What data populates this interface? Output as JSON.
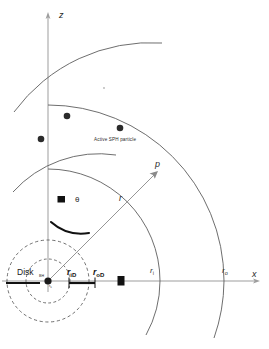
{
  "figure": {
    "background_color": "#ffffff",
    "line_color": "#555555",
    "axis_color": "#9a9a9a",
    "accent_color": "#111111",
    "dash_color": "#4a4a4a"
  },
  "axes": {
    "z_label": "z",
    "x_label": "x",
    "origin": {
      "x": 48,
      "y": 281
    }
  },
  "labels": {
    "disk": "Disk",
    "black_hole": "BH",
    "schwarzschild_radius": {
      "symbol": "r",
      "sub": "s"
    },
    "inner_disk_radius": {
      "symbol": "r",
      "sub": "iD"
    },
    "outer_disk_radius": {
      "symbol": "r",
      "sub": "oD"
    },
    "inner_grid_radius": {
      "symbol": "r",
      "sub": "i"
    },
    "outer_grid_radius": {
      "symbol": "r",
      "sub": "o"
    },
    "particle_note": "Active SPH particle",
    "ray_point": "p",
    "ray_length": "r",
    "angle": "θ"
  },
  "arcs": [
    {
      "name": "inner-grid-arc",
      "radius": 112,
      "label": "r_i"
    },
    {
      "name": "outer-grid-arc",
      "radius": 176,
      "label": "r_o"
    },
    {
      "name": "inner-shell-arc",
      "radius": 80,
      "label": ""
    },
    {
      "name": "outer-shell-arc",
      "radius": 168,
      "label": ""
    }
  ],
  "dashed_circles": [
    {
      "name": "inner-dashed-circle",
      "radius": 22
    },
    {
      "name": "outer-dashed-circle",
      "radius": 41
    }
  ],
  "particles": [
    {
      "name": "sph-particle-1",
      "x": 67,
      "y": 116
    },
    {
      "name": "sph-particle-2",
      "x": 41,
      "y": 139
    },
    {
      "name": "sph-particle-3",
      "x": 120,
      "y": 128
    }
  ],
  "tick_marks": [
    {
      "name": "z-axis-tick",
      "x": 61,
      "y": 200
    },
    {
      "name": "x-axis-tick",
      "x": 121,
      "y": 281
    }
  ],
  "disk_bar": {
    "x1": 8,
    "x2": 40,
    "y": 283
  },
  "radius_bar": {
    "x1": 69,
    "x2": 95,
    "y": 283
  },
  "ray": {
    "from_x": 48,
    "from_y": 281,
    "to_x": 157,
    "to_y": 172
  }
}
